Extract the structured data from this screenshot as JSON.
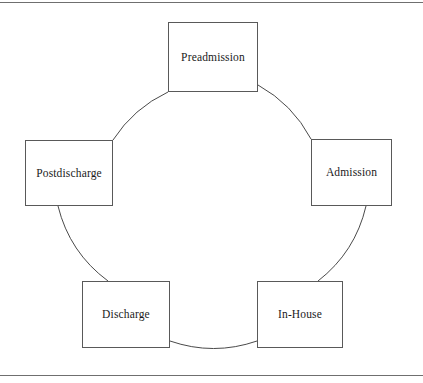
{
  "figure": {
    "type": "cycle-diagram",
    "shape": "circle",
    "orientation": "clockwise",
    "frame": {
      "top_rule": true,
      "bottom_rule": true,
      "left_rule": false,
      "right_rule": false,
      "rule_color": "#6f6f6f"
    },
    "colors": {
      "background": "#ffffff",
      "box_border": "#595959",
      "circle_stroke": "#4a4a4a",
      "text": "#1a1a1a"
    },
    "circle": {
      "center_x": 212,
      "center_y": 195,
      "radius": 133
    },
    "nodes": [
      {
        "id": "preadmission",
        "label": "Preadmission",
        "position": "top"
      },
      {
        "id": "admission",
        "label": "Admission",
        "position": "right"
      },
      {
        "id": "inhouse",
        "label": "In-House",
        "position": "bottom-right"
      },
      {
        "id": "discharge",
        "label": "Discharge",
        "position": "bottom-left"
      },
      {
        "id": "postdischarge",
        "label": "Postdischarge",
        "position": "left"
      }
    ]
  }
}
